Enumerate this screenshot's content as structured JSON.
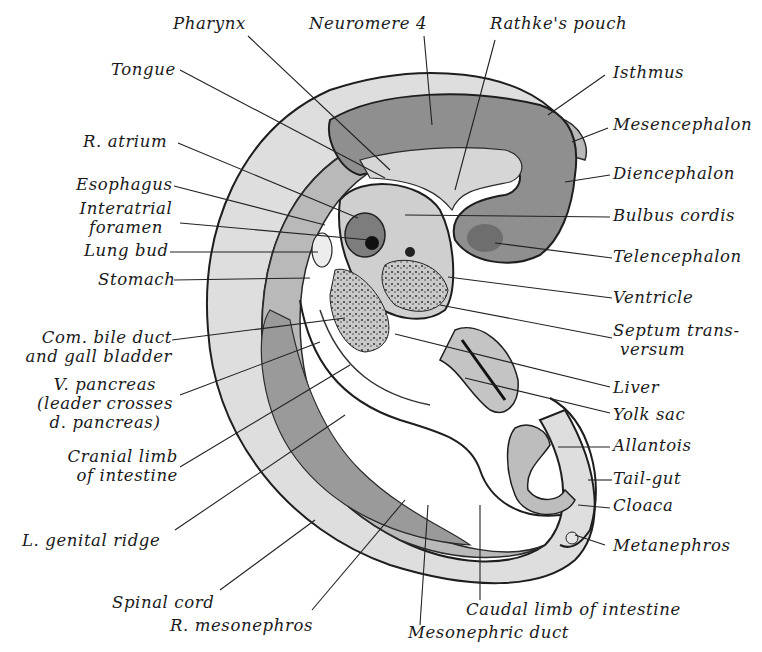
{
  "figure": {
    "colors": {
      "background": "#ffffff",
      "outline": "#1e1e1e",
      "light_tissue": "#dcdcdc",
      "mid_tissue": "#b4b4b4",
      "dark_tissue": "#8a8a8a",
      "leader_line": "#222222"
    }
  },
  "labels": {
    "pharynx": "Pharynx",
    "neuromere4": "Neuromere 4",
    "rathkes_pouch": "Rathke's pouch",
    "tongue": "Tongue",
    "isthmus": "Isthmus",
    "mesencephalon": "Mesencephalon",
    "r_atrium": "R. atrium",
    "diencephalon": "Diencephalon",
    "esophagus": "Esophagus",
    "interatrial_1": "Interatrial",
    "interatrial_2": "foramen",
    "bulbus_cordis": "Bulbus cordis",
    "lung_bud": "Lung bud",
    "telencephalon": "Telencephalon",
    "stomach": "Stomach",
    "ventricle": "Ventricle",
    "bile_1": "Com. bile duct",
    "bile_2": "and gall bladder",
    "septum_1": "Septum trans-",
    "septum_2": "versum",
    "vpancreas_1": "V. pancreas",
    "vpancreas_2": "(leader crosses",
    "vpancreas_3": "d. pancreas)",
    "liver": "Liver",
    "yolk_sac": "Yolk sac",
    "cranial_1": "Cranial limb",
    "cranial_2": "of intestine",
    "allantois": "Allantois",
    "tail_gut": "Tail-gut",
    "cloaca": "Cloaca",
    "genital_ridge": "L. genital ridge",
    "metanephros": "Metanephros",
    "spinal_cord": "Spinal cord",
    "r_mesonephros": "R. mesonephros",
    "caudal_limb": "Caudal limb of intestine",
    "mesonephric_duct": "Mesonephric duct"
  }
}
